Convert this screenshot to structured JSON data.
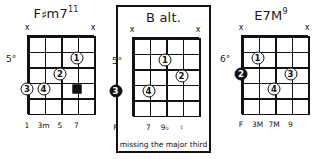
{
  "figure": {
    "kind": "guitar-chord-diagram-set",
    "caption": "missing the major third"
  },
  "chords": [
    {
      "id": "fsharp-m7-11",
      "title_root": "F",
      "title_accidental": "♯",
      "title_quality": "m7",
      "title_extension": "11",
      "title_plain": "F#m7(11)",
      "position_marker": "5°",
      "framed": false,
      "strings": 5,
      "frets": 5,
      "mutes": [
        {
          "string": 1,
          "mark": "x"
        },
        {
          "string": 5,
          "mark": "x"
        }
      ],
      "fingers": [
        {
          "label": "1",
          "string": 4,
          "fret": 2,
          "style": "open"
        },
        {
          "label": "2",
          "string": 3,
          "fret": 3,
          "style": "open"
        },
        {
          "label": "3",
          "string": 1,
          "fret": 4,
          "style": "open"
        },
        {
          "label": "4",
          "string": 2,
          "fret": 4,
          "style": "open"
        },
        {
          "label": "",
          "string": 4,
          "fret": 4,
          "style": "square"
        }
      ],
      "interval_labels": [
        {
          "string": 1,
          "text": "1"
        },
        {
          "string": 2,
          "text": "3m"
        },
        {
          "string": 3,
          "text": "5"
        },
        {
          "string": 4,
          "text": "7"
        }
      ],
      "note": ""
    },
    {
      "id": "b-alt",
      "title_root": "B",
      "title_accidental": "",
      "title_quality": " alt.",
      "title_extension": "",
      "title_plain": "B alt.",
      "position_marker": "5°",
      "framed": true,
      "strings": 5,
      "frets": 5,
      "mutes": [
        {
          "string": 1,
          "mark": "x"
        },
        {
          "string": 5,
          "mark": "x"
        }
      ],
      "fingers": [
        {
          "label": "1",
          "string": 3,
          "fret": 2,
          "style": "open"
        },
        {
          "label": "2",
          "string": 4,
          "fret": 3,
          "style": "open"
        },
        {
          "label": "3",
          "string": 0,
          "fret": 4,
          "style": "filled"
        },
        {
          "label": "4",
          "string": 2,
          "fret": 4,
          "style": "open"
        }
      ],
      "interval_labels": [
        {
          "string": 0,
          "text": "F"
        },
        {
          "string": 2,
          "text": "7"
        },
        {
          "string": 3,
          "text": "9♭"
        },
        {
          "string": 4,
          "text": "♮"
        }
      ],
      "note": "missing the major third"
    },
    {
      "id": "e7m-9",
      "title_root": "E7M",
      "title_accidental": "",
      "title_quality": "",
      "title_extension": "9",
      "title_plain": "E7M(9)",
      "position_marker": "6°",
      "framed": false,
      "strings": 5,
      "frets": 5,
      "mutes": [
        {
          "string": 1,
          "mark": "x"
        },
        {
          "string": 5,
          "mark": "x"
        }
      ],
      "fingers": [
        {
          "label": "1",
          "string": 2,
          "fret": 2,
          "style": "open"
        },
        {
          "label": "2",
          "string": 1,
          "fret": 3,
          "style": "filled"
        },
        {
          "label": "3",
          "string": 4,
          "fret": 3,
          "style": "open"
        },
        {
          "label": "4",
          "string": 3,
          "fret": 4,
          "style": "open"
        }
      ],
      "interval_labels": [
        {
          "string": 1,
          "text": "F"
        },
        {
          "string": 2,
          "text": "3M"
        },
        {
          "string": 3,
          "text": "7M"
        },
        {
          "string": 4,
          "text": "9"
        }
      ],
      "note": ""
    }
  ]
}
